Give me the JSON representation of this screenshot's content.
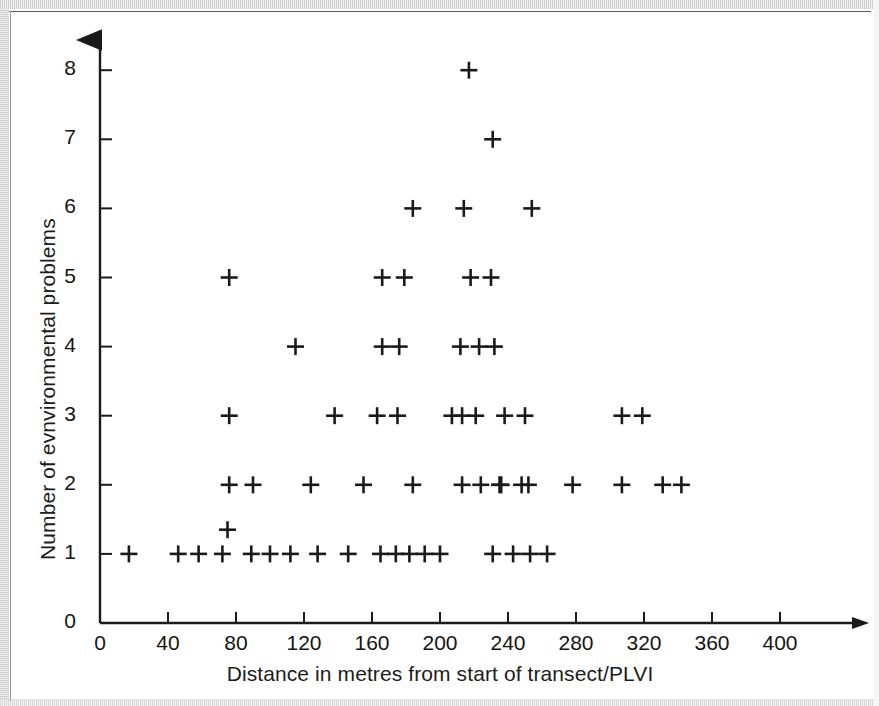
{
  "chart_data": {
    "type": "scatter",
    "title": "",
    "xlabel": "Distance in metres from start of transect/PLVI",
    "ylabel": "Number of evnvironmental problems",
    "xlim": [
      0,
      420
    ],
    "ylim": [
      0,
      8.6
    ],
    "grid": false,
    "legend": null,
    "marker": "+",
    "marker_color": "#1a1a1a",
    "xticks": [
      0,
      40,
      80,
      120,
      160,
      200,
      240,
      280,
      320,
      360,
      400
    ],
    "xtick_labels": [
      "0",
      "40",
      "80",
      "120",
      "160",
      "200",
      "240",
      "280",
      "320",
      "360",
      "400"
    ],
    "yticks": [
      0,
      1,
      2,
      3,
      4,
      5,
      6,
      7,
      8
    ],
    "ytick_labels": [
      "0",
      "1",
      "2",
      "3",
      "4",
      "5",
      "6",
      "7",
      "8"
    ],
    "points": [
      {
        "x": 17,
        "y": 1
      },
      {
        "x": 46,
        "y": 1
      },
      {
        "x": 58,
        "y": 1
      },
      {
        "x": 72,
        "y": 1
      },
      {
        "x": 75,
        "y": 1.35
      },
      {
        "x": 89,
        "y": 1
      },
      {
        "x": 100,
        "y": 1
      },
      {
        "x": 112,
        "y": 1
      },
      {
        "x": 128,
        "y": 1
      },
      {
        "x": 146,
        "y": 1
      },
      {
        "x": 165,
        "y": 1
      },
      {
        "x": 174,
        "y": 1
      },
      {
        "x": 182,
        "y": 1
      },
      {
        "x": 191,
        "y": 1
      },
      {
        "x": 200,
        "y": 1
      },
      {
        "x": 231,
        "y": 1
      },
      {
        "x": 243,
        "y": 1
      },
      {
        "x": 253,
        "y": 1
      },
      {
        "x": 263,
        "y": 1
      },
      {
        "x": 76,
        "y": 2
      },
      {
        "x": 90,
        "y": 2
      },
      {
        "x": 124,
        "y": 2
      },
      {
        "x": 155,
        "y": 2
      },
      {
        "x": 184,
        "y": 2
      },
      {
        "x": 213,
        "y": 2
      },
      {
        "x": 224,
        "y": 2
      },
      {
        "x": 235,
        "y": 2
      },
      {
        "x": 248,
        "y": 2
      },
      {
        "x": 236,
        "y": 2
      },
      {
        "x": 252,
        "y": 2
      },
      {
        "x": 278,
        "y": 2
      },
      {
        "x": 307,
        "y": 2
      },
      {
        "x": 331,
        "y": 2
      },
      {
        "x": 342,
        "y": 2
      },
      {
        "x": 76,
        "y": 3
      },
      {
        "x": 138,
        "y": 3
      },
      {
        "x": 163,
        "y": 3
      },
      {
        "x": 175,
        "y": 3
      },
      {
        "x": 207,
        "y": 3
      },
      {
        "x": 213,
        "y": 3
      },
      {
        "x": 221,
        "y": 3
      },
      {
        "x": 238,
        "y": 3
      },
      {
        "x": 250,
        "y": 3
      },
      {
        "x": 307,
        "y": 3
      },
      {
        "x": 319,
        "y": 3
      },
      {
        "x": 115,
        "y": 4
      },
      {
        "x": 166,
        "y": 4
      },
      {
        "x": 176,
        "y": 4
      },
      {
        "x": 212,
        "y": 4
      },
      {
        "x": 223,
        "y": 4
      },
      {
        "x": 232,
        "y": 4
      },
      {
        "x": 76,
        "y": 5
      },
      {
        "x": 166,
        "y": 5
      },
      {
        "x": 179,
        "y": 5
      },
      {
        "x": 218,
        "y": 5
      },
      {
        "x": 230,
        "y": 5
      },
      {
        "x": 184,
        "y": 6
      },
      {
        "x": 214,
        "y": 6
      },
      {
        "x": 254,
        "y": 6
      },
      {
        "x": 231,
        "y": 7
      },
      {
        "x": 217,
        "y": 8
      }
    ]
  },
  "axes": {
    "x_axis_arrow": "arrow-right",
    "y_axis_arrow": "arrow-up"
  }
}
